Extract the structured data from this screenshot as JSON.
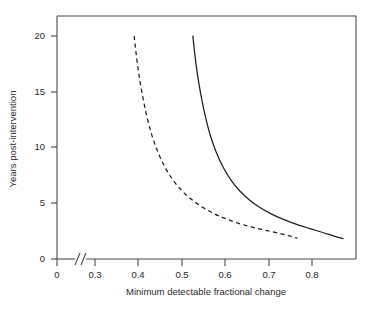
{
  "chart_data": {
    "type": "line",
    "title": "",
    "subtitle": "",
    "xlabel": "Minimum detectable fractional change",
    "ylabel": "Years post-intervention",
    "xlim": [
      0,
      0.895
    ],
    "ylim": [
      0,
      21.6
    ],
    "grid": false,
    "legend": "none",
    "annotations": [
      "x-axis break between 0 and 0.3"
    ],
    "xticks": [
      0,
      0.3,
      0.4,
      0.5,
      0.6,
      0.7,
      0.8
    ],
    "xtick_labels": [
      "0",
      "0.3",
      "0.4",
      "0.5",
      "0.6",
      "0.7",
      "0.8"
    ],
    "yticks": [
      0,
      5,
      10,
      15,
      20
    ],
    "ytick_labels": [
      "0",
      "5",
      "10",
      "15",
      "20"
    ],
    "series": [
      {
        "name": "dashed-curve",
        "style": "dashed",
        "color": "#1e1e1e",
        "x": [
          0.39,
          0.394,
          0.4,
          0.408,
          0.418,
          0.43,
          0.444,
          0.46,
          0.478,
          0.498,
          0.52,
          0.545,
          0.572,
          0.6,
          0.63,
          0.662,
          0.695,
          0.728,
          0.75,
          0.765
        ],
        "y": [
          20.0,
          18.6,
          16.8,
          14.9,
          13.0,
          11.2,
          9.65,
          8.3,
          7.15,
          6.2,
          5.4,
          4.7,
          4.1,
          3.62,
          3.2,
          2.85,
          2.55,
          2.25,
          2.05,
          1.85
        ]
      },
      {
        "name": "solid-curve",
        "style": "solid",
        "color": "#1e1e1e",
        "x": [
          0.525,
          0.529,
          0.535,
          0.543,
          0.553,
          0.565,
          0.579,
          0.595,
          0.613,
          0.633,
          0.655,
          0.679,
          0.705,
          0.733,
          0.762,
          0.792,
          0.822,
          0.85,
          0.87
        ],
        "y": [
          20.0,
          18.5,
          16.7,
          14.8,
          12.9,
          11.1,
          9.55,
          8.2,
          7.05,
          6.1,
          5.3,
          4.62,
          4.05,
          3.55,
          3.12,
          2.75,
          2.4,
          2.05,
          1.82
        ]
      }
    ]
  },
  "axes": {
    "x_axis_break_label": "axis-break",
    "x_title": "Minimum detectable fractional change",
    "y_title": "Years post-intervention"
  }
}
